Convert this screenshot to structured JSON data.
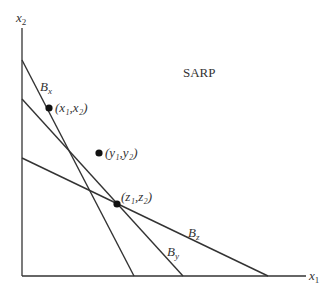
{
  "title": "SARP",
  "axes": {
    "x_label": "x",
    "x_sub": "1",
    "y_label": "x",
    "y_sub": "2"
  },
  "budget_lines": [
    {
      "name": "B",
      "sub": "x"
    },
    {
      "name": "B",
      "sub": "y"
    },
    {
      "name": "B",
      "sub": "z"
    }
  ],
  "points": [
    {
      "label": "(x₁,x₂)"
    },
    {
      "label": "(y₁,y₂)"
    },
    {
      "label": "(z₁,z₂)"
    }
  ],
  "colors": {
    "line": "#333333",
    "point": "#111111",
    "text": "#333333"
  }
}
